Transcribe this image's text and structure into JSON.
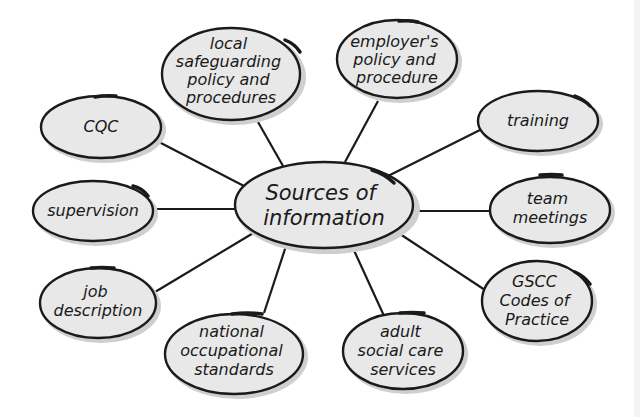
{
  "diagram": {
    "type": "mind-map",
    "center": {
      "label_lines": [
        "Sources of",
        "information"
      ]
    },
    "nodes": [
      {
        "id": "local-safeguarding",
        "label_lines": [
          "local",
          "safeguarding",
          "policy and",
          "procedures"
        ]
      },
      {
        "id": "employers-policy",
        "label_lines": [
          "employer's",
          "policy and",
          "procedure"
        ]
      },
      {
        "id": "training",
        "label_lines": [
          "training"
        ]
      },
      {
        "id": "team-meetings",
        "label_lines": [
          "team",
          "meetings"
        ]
      },
      {
        "id": "gscc-codes",
        "label_lines": [
          "GSCC",
          "Codes of",
          "Practice"
        ]
      },
      {
        "id": "adult-social-care",
        "label_lines": [
          "adult",
          "social care",
          "services"
        ]
      },
      {
        "id": "national-occupational",
        "label_lines": [
          "national",
          "occupational",
          "standards"
        ]
      },
      {
        "id": "job-description",
        "label_lines": [
          "job",
          "description"
        ]
      },
      {
        "id": "supervision",
        "label_lines": [
          "supervision"
        ]
      },
      {
        "id": "cqc",
        "label_lines": [
          "CQC"
        ]
      }
    ],
    "colors": {
      "node_fill": "#e8e8e8",
      "stroke": "#1a1a1a",
      "shadow": "#cfcfcf",
      "background": "#ffffff"
    }
  }
}
